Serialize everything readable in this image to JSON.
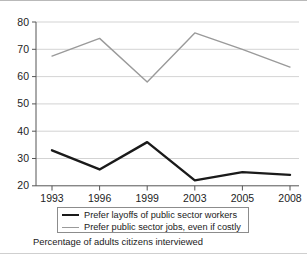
{
  "chart_data": {
    "type": "line",
    "title": "",
    "subtitle": "",
    "caption": "Percentage of adults citizens interviewed",
    "xlabel": "",
    "ylabel": "",
    "categories": [
      "1993",
      "1996",
      "1999",
      "2003",
      "2005",
      "2008"
    ],
    "ylim": [
      20,
      80
    ],
    "yticks": [
      20,
      30,
      40,
      50,
      60,
      70,
      80
    ],
    "ytick_labels": [
      "20",
      "30",
      "40",
      "50",
      "60",
      "70",
      "80"
    ],
    "grid": true,
    "grid_axis": "y",
    "legend_position": "below-axes",
    "series": [
      {
        "name": "Prefer layoffs of public sector workers",
        "color": "#1a1a1a",
        "width": 2.4,
        "values": [
          33,
          26,
          36,
          22,
          25,
          24
        ]
      },
      {
        "name": "Prefer public sector jobs, even if costly",
        "color": "#9a9a9a",
        "width": 1.4,
        "values": [
          67.5,
          74,
          58,
          76,
          70,
          63.5
        ]
      }
    ]
  },
  "axes": {
    "y_tick_labels": [
      "80",
      "70",
      "60",
      "50",
      "40",
      "30",
      "20"
    ],
    "x_tick_labels": [
      "1993",
      "1996",
      "1999",
      "2003",
      "2005",
      "2008"
    ]
  },
  "legend": {
    "items": [
      {
        "label": "Prefer layoffs of public sector workers",
        "swatch": "black-line-swatch"
      },
      {
        "label": "Prefer public sector jobs, even if costly",
        "swatch": "gray-line-swatch"
      }
    ]
  },
  "caption": {
    "text": "Percentage of adults citizens interviewed"
  },
  "colors": {
    "series_black": "#1a1a1a",
    "series_gray": "#9a9a9a",
    "grid": "#c8c8c8",
    "axis": "#555555",
    "background": "#ffffff"
  }
}
